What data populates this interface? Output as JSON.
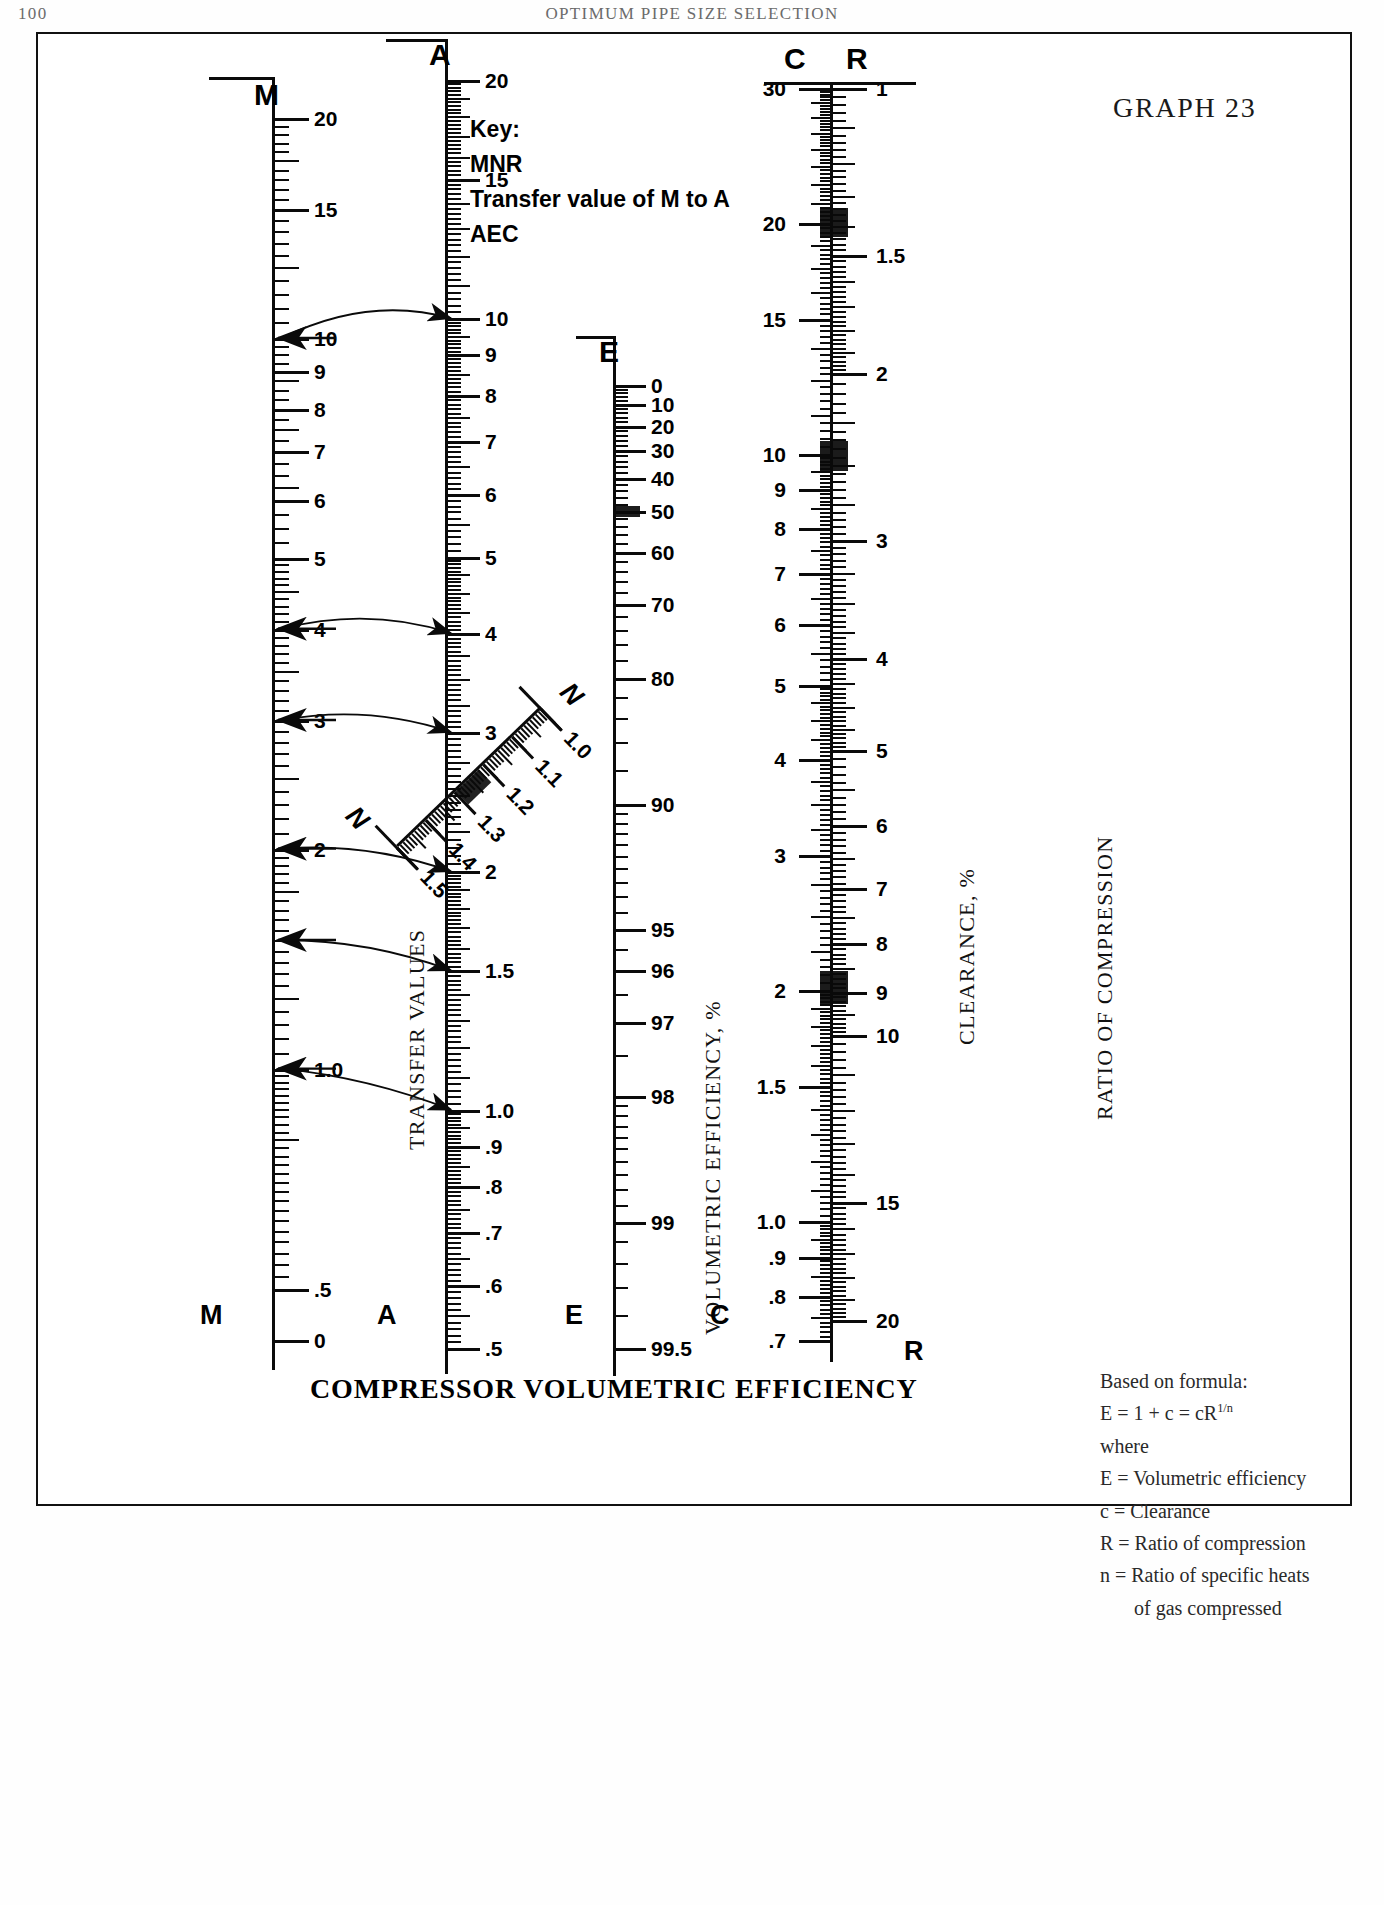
{
  "running_head": {
    "folio": "100",
    "title": "OPTIMUM PIPE SIZE SELECTION"
  },
  "graph_number": "GRAPH 23",
  "bottom_caption": "COMPRESSOR VOLUMETRIC EFFICIENCY",
  "key": {
    "lines": [
      "Key:",
      "MNR",
      "Transfer value of M to A",
      "AEC"
    ]
  },
  "captions": {
    "transfer_values": "TRANSFER VALUES",
    "volumetric_efficiency": "VOLUMETRIC EFFICIENCY, %",
    "clearance": "CLEARANCE, %",
    "ratio_of_compression": "RATIO OF COMPRESSION"
  },
  "formula": {
    "heading": "Based on formula:",
    "equation_lhs": "E = 1 + c = cR",
    "equation_exp": "1/n",
    "where": "where",
    "definitions": [
      "E = Volumetric efficiency",
      "c = Clearance",
      "R = Ratio of compression",
      "n = Ratio of specific heats",
      "of gas compressed"
    ]
  },
  "chart_data": {
    "type": "nomogram",
    "title": "Compressor Volumetric Efficiency",
    "scales": [
      {
        "id": "M",
        "name": "M",
        "axis_label_top": "M",
        "axis_label_bottom": "M",
        "caption": "TRANSFER VALUES",
        "orientation": "vertical",
        "label_side": "right",
        "direction": "descending",
        "range": [
          0,
          20
        ],
        "labeled_ticks": [
          "20",
          "15",
          "10",
          "9",
          "8",
          "7",
          "6",
          "5",
          "4",
          "3",
          "2",
          "1.0",
          ".5",
          "0"
        ],
        "label_values": [
          20,
          15,
          10,
          9,
          8,
          7,
          6,
          5,
          4,
          3,
          2,
          1.0,
          0.5,
          0
        ]
      },
      {
        "id": "A",
        "name": "A",
        "axis_label_top": "A",
        "axis_label_bottom": "A",
        "caption": "TRANSFER VALUES",
        "orientation": "vertical",
        "label_side": "right",
        "direction": "descending",
        "range": [
          0.5,
          20
        ],
        "labeled_ticks": [
          "20",
          "15",
          "10",
          "9",
          "8",
          "7",
          "6",
          "5",
          "4",
          "3",
          "2",
          "1.5",
          "1.0",
          ".9",
          ".8",
          ".7",
          ".6",
          ".5"
        ],
        "label_values": [
          20,
          15,
          10,
          9,
          8,
          7,
          6,
          5,
          4,
          3,
          2,
          1.5,
          1.0,
          0.9,
          0.8,
          0.7,
          0.6,
          0.5
        ]
      },
      {
        "id": "N",
        "name": "N",
        "axis_label_top": "N",
        "axis_label_bottom": "N",
        "orientation": "diagonal",
        "label_side": "right",
        "direction": "descending",
        "range": [
          1.0,
          1.5
        ],
        "labeled_ticks": [
          "1.0",
          "1.1",
          "1.2",
          "1.3",
          "1.4",
          "1.5"
        ],
        "label_values": [
          1.0,
          1.1,
          1.2,
          1.3,
          1.4,
          1.5
        ]
      },
      {
        "id": "E",
        "name": "E",
        "axis_label_top": "E",
        "axis_label_bottom": "E",
        "caption": "VOLUMETRIC EFFICIENCY, %",
        "orientation": "vertical",
        "label_side": "right",
        "direction": "descending",
        "range": [
          0,
          99.5
        ],
        "labeled_ticks": [
          "0",
          "10",
          "20",
          "30",
          "40",
          "50",
          "60",
          "70",
          "80",
          "90",
          "95",
          "96",
          "97",
          "98",
          "99",
          "99.5"
        ],
        "label_values": [
          0,
          10,
          20,
          30,
          40,
          50,
          60,
          70,
          80,
          90,
          95,
          96,
          97,
          98,
          99,
          99.5
        ]
      },
      {
        "id": "C",
        "name": "C",
        "axis_label_top": "C",
        "axis_label_bottom": "C",
        "caption": "CLEARANCE, %",
        "orientation": "vertical",
        "label_side": "left",
        "direction": "descending",
        "range": [
          0.7,
          30
        ],
        "labeled_ticks": [
          "30",
          "20",
          "15",
          "10",
          "9",
          "8",
          "7",
          "6",
          "5",
          "4",
          "3",
          "2",
          "1.5",
          "1.0",
          ".9",
          ".8",
          ".7"
        ],
        "label_values": [
          30,
          20,
          15,
          10,
          9,
          8,
          7,
          6,
          5,
          4,
          3,
          2,
          1.5,
          1.0,
          0.9,
          0.8,
          0.7
        ]
      },
      {
        "id": "R",
        "name": "R",
        "axis_label_top": "R",
        "axis_label_bottom": "R",
        "caption": "RATIO OF COMPRESSION",
        "orientation": "vertical",
        "label_side": "right",
        "direction": "ascending",
        "range": [
          1,
          20
        ],
        "labeled_ticks": [
          "1",
          "1.5",
          "2",
          "3",
          "4",
          "5",
          "6",
          "7",
          "8",
          "9",
          "10",
          "15",
          "20"
        ],
        "label_values": [
          1,
          1.5,
          2,
          3,
          4,
          5,
          6,
          7,
          8,
          9,
          10,
          15,
          20
        ]
      }
    ],
    "index_markers": [
      {
        "scale": "M",
        "value": 10.0
      },
      {
        "scale": "M",
        "value": 4.0
      },
      {
        "scale": "M",
        "value": 3.0
      },
      {
        "scale": "M",
        "value": 2.0
      },
      {
        "scale": "M",
        "value": 1.5
      },
      {
        "scale": "M",
        "value": 1.0
      },
      {
        "scale": "A",
        "value": 10.0
      },
      {
        "scale": "A",
        "value": 4.0
      },
      {
        "scale": "A",
        "value": 3.0
      },
      {
        "scale": "A",
        "value": 2.0
      },
      {
        "scale": "A",
        "value": 1.5
      },
      {
        "scale": "A",
        "value": 1.0
      }
    ],
    "transfer_arrows": [
      {
        "from_scale": "M",
        "from_value": 10.0,
        "to_scale": "A",
        "to_value": 10.0
      },
      {
        "from_scale": "M",
        "from_value": 4.0,
        "to_scale": "A",
        "to_value": 4.0
      },
      {
        "from_scale": "M",
        "from_value": 3.0,
        "to_scale": "A",
        "to_value": 3.0
      },
      {
        "from_scale": "M",
        "from_value": 2.0,
        "to_scale": "A",
        "to_value": 2.0
      },
      {
        "from_scale": "M",
        "from_value": 1.5,
        "to_scale": "A",
        "to_value": 1.5
      },
      {
        "from_scale": "M",
        "from_value": 1.0,
        "to_scale": "A",
        "to_value": 1.0
      }
    ],
    "heavy_bands": [
      {
        "scale": "E",
        "near_value": 50
      },
      {
        "scale": "C",
        "near_value": 20
      },
      {
        "scale": "C",
        "near_value": 10
      },
      {
        "scale": "C",
        "near_value": 2
      },
      {
        "scale": "N",
        "near_value": 1.25
      }
    ],
    "colors": {
      "ink": "#0a0a0a",
      "paper": "#ffffff",
      "frame": "#111111",
      "runhead": "#6b6b6b"
    }
  }
}
